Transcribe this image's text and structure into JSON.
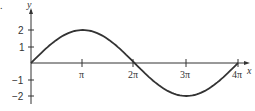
{
  "chart_data": {
    "type": "line",
    "title": "",
    "panel_label": ".",
    "xlabel": "x",
    "ylabel": "y",
    "function": "y = 2 sin(x/2)",
    "xlim": [
      0,
      12.566
    ],
    "ylim": [
      -2,
      2
    ],
    "x_ticks": [
      "π",
      "2π",
      "3π",
      "4π"
    ],
    "y_ticks": [
      "2",
      "1",
      "−1",
      "−2"
    ],
    "series": [
      {
        "name": "curve",
        "x": [
          "0",
          "π",
          "2π",
          "3π",
          "4π"
        ],
        "values": [
          0,
          2,
          0,
          -2,
          0
        ]
      }
    ],
    "grid": false,
    "legend": "none"
  }
}
